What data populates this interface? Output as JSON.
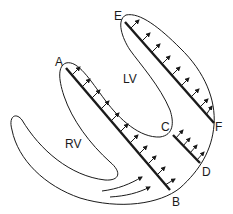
{
  "diagram": {
    "chambers": [
      {
        "id": "lv",
        "label": "LV"
      },
      {
        "id": "rv",
        "label": "RV"
      }
    ],
    "points": [
      {
        "id": "A",
        "label": "A"
      },
      {
        "id": "B",
        "label": "B"
      },
      {
        "id": "C",
        "label": "C"
      },
      {
        "id": "D",
        "label": "D"
      },
      {
        "id": "E",
        "label": "E"
      },
      {
        "id": "F",
        "label": "F"
      }
    ],
    "segments": [
      {
        "from": "A",
        "to": "B",
        "arrows": 11
      },
      {
        "from": "C",
        "to": "D",
        "arrows": 4
      },
      {
        "from": "E",
        "to": "F",
        "arrows": 9
      }
    ],
    "flow_arrows": 2,
    "colors": {
      "line": "#1a1a1a",
      "background": "#ffffff"
    }
  }
}
